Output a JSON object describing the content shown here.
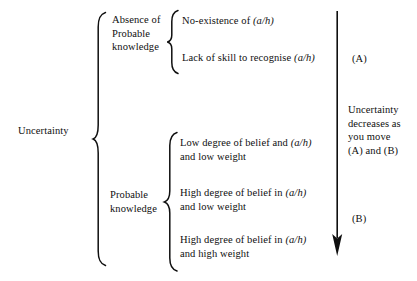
{
  "diagram": {
    "root": {
      "label": "Uncertainty"
    },
    "branches": [
      {
        "label_lines": [
          "Absence of",
          "Probable",
          "knowledge"
        ],
        "label": "Absence of Probable knowledge",
        "leaves": [
          {
            "text_before": "No-existence of ",
            "notation": "(a/h)",
            "text_after": "",
            "line2": ""
          },
          {
            "text_before": "Lack of skill to recognise ",
            "notation": "(a/h)",
            "text_after": "",
            "line2": ""
          }
        ]
      },
      {
        "label_lines": [
          "Probable",
          "knowledge"
        ],
        "label": "Probable knowledge",
        "leaves": [
          {
            "text_before": "Low degree of belief and ",
            "notation": "(a/h)",
            "text_after": "",
            "line2": "and low weight"
          },
          {
            "text_before": "High degree of belief in ",
            "notation": "(a/h)",
            "text_after": "",
            "line2": "and low weight"
          },
          {
            "text_before": "High degree of belief in ",
            "notation": "(a/h)",
            "text_after": "",
            "line2": "and high weight"
          }
        ]
      }
    ],
    "annotation": {
      "marker_a": "(A)",
      "marker_b": "(B)",
      "note_lines": [
        "Uncertainty",
        "decreases as",
        "you move",
        "(A) and (B)"
      ],
      "note": "Uncertainty decreases as you move (A) and (B)",
      "arrow_direction": "down"
    },
    "colors": {
      "ink": "#0f0f0f",
      "background": "#ffffff"
    }
  }
}
